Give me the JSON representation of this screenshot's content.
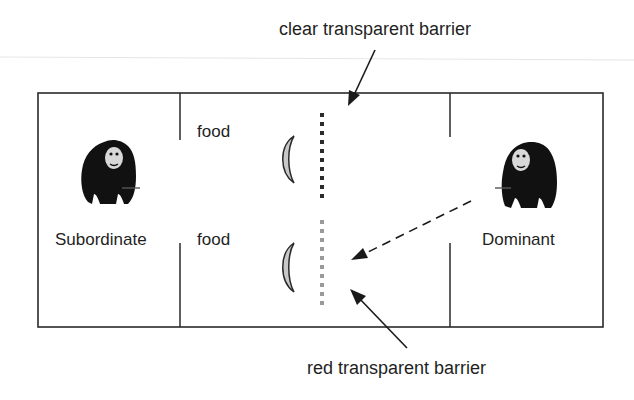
{
  "labels": {
    "top_callout": "clear transparent barrier",
    "bottom_callout": "red transparent barrier",
    "food_top": "food",
    "food_bottom": "food",
    "left_animal": "Subordinate",
    "right_animal": "Dominant"
  },
  "icons": {
    "left_animal": "chimpanzee-icon",
    "right_animal": "chimpanzee-icon",
    "food": "banana-icon"
  },
  "colors": {
    "line": "#2a2a2a",
    "clear_barrier": "#2b2b2b",
    "red_barrier": "#9a9a9a",
    "food_fill": "#c8c8c8",
    "chimp": "#111111"
  }
}
